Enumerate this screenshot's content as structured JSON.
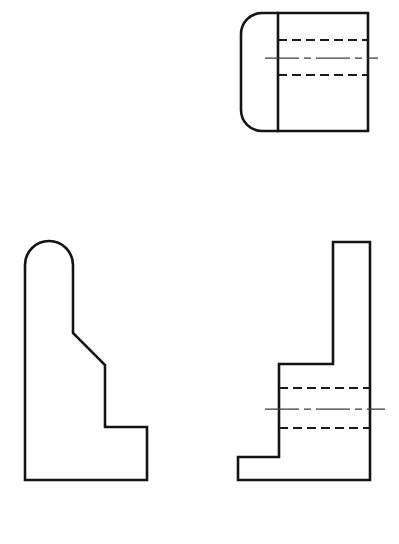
{
  "sheet": {
    "title": "Orthographic Multiview Drawing",
    "width": 399,
    "height": 544,
    "background_color": "#ffffff",
    "line_color": "#141414",
    "hidden_line_color": "#1a1a1a",
    "center_line_color": "#3c3c3c"
  },
  "views": {
    "top_view": {
      "name": "Top View",
      "position": "upper-right",
      "bounds": {
        "x": 241,
        "y": 13,
        "width": 127,
        "height": 118
      },
      "outline_path": "M 262 13 L 368 13 L 368 131 L 262 131 A 21 21 0 0 1 241 110 L 241 34 A 21 21 0 0 1 262 13 Z",
      "partition_line": {
        "x1": 278,
        "y1": 13,
        "x2": 278,
        "y2": 131
      },
      "hidden_lines": [
        {
          "x1": 278,
          "y1": 40,
          "x2": 368,
          "y2": 40
        },
        {
          "x1": 278,
          "y1": 75,
          "x2": 368,
          "y2": 75
        }
      ],
      "center_lines": [
        {
          "x1": 265,
          "y1": 58,
          "x2": 378,
          "y2": 58
        }
      ]
    },
    "front_view": {
      "name": "Front View",
      "position": "lower-left",
      "bounds": {
        "x": 25,
        "y": 241,
        "width": 122,
        "height": 239
      },
      "outline_path": "M 25 480 L 25 265 A 24 24 0 0 1 73 265 L 73 333 L 105 365 L 105 427 L 147 427 L 147 480 Z",
      "hidden_lines": [],
      "center_lines": []
    },
    "side_view": {
      "name": "Right Side View",
      "position": "lower-right",
      "bounds": {
        "x": 238,
        "y": 242,
        "width": 132,
        "height": 238
      },
      "outline_path": "M 333 242 L 370 242 L 370 480 L 238 480 L 238 457 L 279 457 L 279 364 L 333 364 Z",
      "hidden_lines": [
        {
          "x1": 279,
          "y1": 388,
          "x2": 370,
          "y2": 388
        },
        {
          "x1": 279,
          "y1": 428,
          "x2": 370,
          "y2": 428
        }
      ],
      "center_lines": [
        {
          "x1": 265,
          "y1": 409,
          "x2": 385,
          "y2": 409
        }
      ]
    }
  }
}
